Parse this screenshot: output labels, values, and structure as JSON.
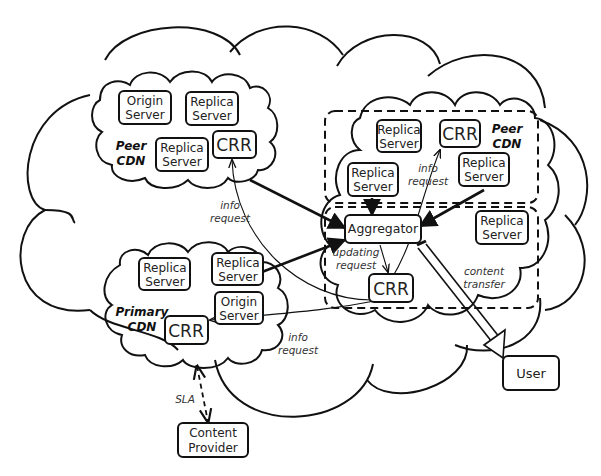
{
  "diagram": {
    "peer_cdn_left": {
      "label_line1": "Peer",
      "label_line2": "CDN",
      "origin_server": [
        "Origin",
        "Server"
      ],
      "replica_server_1": [
        "Replica",
        "Server"
      ],
      "replica_server_2": [
        "Replica",
        "Server"
      ],
      "crr": "CRR"
    },
    "peer_cdn_right": {
      "label_line1": "Peer",
      "label_line2": "CDN",
      "replica_server_1": [
        "Replica",
        "Server"
      ],
      "replica_server_2": [
        "Replica",
        "Server"
      ],
      "replica_server_3": [
        "Replica",
        "Server"
      ],
      "crr": "CRR"
    },
    "aggregator_zone": {
      "aggregator": "Aggregator",
      "replica_server": [
        "Replica",
        "Server"
      ],
      "crr": "CRR"
    },
    "primary_cdn": {
      "label_line1": "Primary",
      "label_line2": "CDN",
      "replica_server_1": [
        "Replica",
        "Server"
      ],
      "replica_server_2": [
        "Replica",
        "Server"
      ],
      "origin_server": [
        "Origin",
        "Server"
      ],
      "crr": "CRR"
    },
    "content_provider": [
      "Content",
      "Provider"
    ],
    "user": "User",
    "edge_labels": {
      "info_request_top": [
        "info",
        "request"
      ],
      "info_request_left": [
        "info",
        "request"
      ],
      "info_request_bottom": [
        "info",
        "request"
      ],
      "updating_request": [
        "updating",
        "request"
      ],
      "content_transfer": [
        "content",
        "transfer"
      ],
      "sla": "SLA"
    }
  }
}
